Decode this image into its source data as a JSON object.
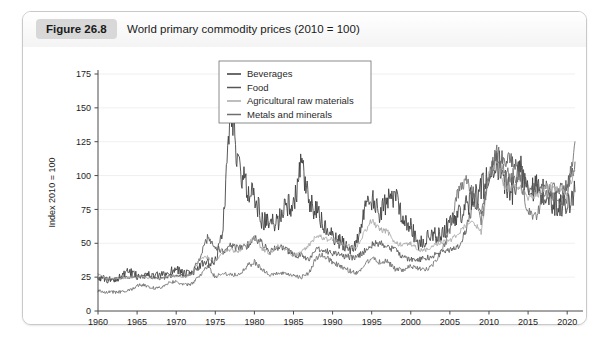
{
  "figure": {
    "badge": "Figure 26.8",
    "title": "World primary commodity prices (2010  =  100)"
  },
  "chart_data": {
    "type": "line",
    "title": "World primary commodity prices (2010  =  100)",
    "xlabel": "",
    "ylabel": "Index 2010 = 100",
    "xlim": [
      1960,
      2021
    ],
    "ylim": [
      0,
      175
    ],
    "ytick_step": 25,
    "yticks": [
      0,
      25,
      50,
      75,
      100,
      125,
      150,
      175
    ],
    "xticks": [
      1960,
      1965,
      1970,
      1975,
      1980,
      1985,
      1990,
      1995,
      2000,
      2005,
      2010,
      2015,
      2020
    ],
    "grid": true,
    "legend_position": "top-center",
    "colors": {
      "beverages": "#3a3a3a",
      "food": "#565656",
      "agricultural_raw_materials": "#a8a8a8",
      "metals_and_minerals": "#6e6e6e"
    },
    "x": [
      1960,
      1961,
      1962,
      1963,
      1964,
      1965,
      1966,
      1967,
      1968,
      1969,
      1970,
      1971,
      1972,
      1973,
      1974,
      1975,
      1976,
      1977,
      1978,
      1979,
      1980,
      1981,
      1982,
      1983,
      1984,
      1985,
      1986,
      1987,
      1988,
      1989,
      1990,
      1991,
      1992,
      1993,
      1994,
      1995,
      1996,
      1997,
      1998,
      1999,
      2000,
      2001,
      2002,
      2003,
      2004,
      2005,
      2006,
      2007,
      2008,
      2009,
      2010,
      2011,
      2012,
      2013,
      2014,
      2015,
      2016,
      2017,
      2018,
      2019,
      2020,
      2021
    ],
    "series": [
      {
        "name": "Beverages",
        "values": [
          25,
          23,
          23,
          26,
          29,
          26,
          27,
          26,
          26,
          28,
          32,
          27,
          28,
          33,
          35,
          36,
          62,
          158,
          104,
          92,
          85,
          67,
          64,
          66,
          80,
          76,
          108,
          79,
          73,
          62,
          54,
          51,
          47,
          48,
          73,
          82,
          72,
          80,
          87,
          70,
          62,
          49,
          53,
          57,
          56,
          66,
          71,
          76,
          85,
          90,
          100,
          111,
          96,
          88,
          106,
          93,
          91,
          87,
          80,
          79,
          78,
          88
        ],
        "stroke": "#3a3a3a"
      },
      {
        "name": "Food",
        "values": [
          24,
          24,
          23,
          25,
          25,
          25,
          26,
          25,
          24,
          25,
          27,
          26,
          28,
          39,
          54,
          47,
          44,
          48,
          46,
          48,
          54,
          50,
          44,
          47,
          46,
          41,
          41,
          38,
          45,
          45,
          43,
          41,
          40,
          39,
          44,
          49,
          50,
          48,
          45,
          40,
          38,
          38,
          39,
          41,
          44,
          45,
          47,
          59,
          79,
          74,
          100,
          114,
          112,
          110,
          107,
          89,
          90,
          92,
          90,
          89,
          92,
          110
        ],
        "stroke": "#565656"
      },
      {
        "name": "Agricultural raw materials",
        "values": [
          27,
          24,
          24,
          24,
          25,
          25,
          25,
          24,
          24,
          26,
          26,
          25,
          27,
          38,
          40,
          36,
          44,
          45,
          44,
          50,
          54,
          46,
          42,
          48,
          46,
          41,
          43,
          49,
          56,
          53,
          53,
          50,
          48,
          47,
          57,
          67,
          60,
          59,
          50,
          49,
          50,
          45,
          45,
          49,
          51,
          52,
          57,
          63,
          66,
          58,
          100,
          111,
          91,
          91,
          91,
          84,
          85,
          90,
          94,
          89,
          87,
          104
        ],
        "stroke": "#a8a8a8"
      },
      {
        "name": "Metals and minerals",
        "values": [
          15,
          14,
          14,
          14,
          15,
          19,
          19,
          17,
          17,
          21,
          22,
          19,
          20,
          26,
          33,
          25,
          28,
          27,
          27,
          33,
          36,
          31,
          26,
          28,
          27,
          26,
          25,
          28,
          40,
          41,
          36,
          33,
          30,
          28,
          33,
          40,
          36,
          37,
          31,
          30,
          33,
          31,
          31,
          35,
          45,
          59,
          87,
          96,
          87,
          66,
          100,
          118,
          103,
          100,
          97,
          73,
          70,
          85,
          86,
          83,
          84,
          125
        ],
        "stroke": "#6e6e6e"
      }
    ],
    "annotations": [
      {
        "text": "Beverages peak 1977",
        "value": 158
      },
      {
        "text": "Metals final 2021",
        "value": 125
      }
    ]
  },
  "legend": {
    "items": [
      {
        "label": "Beverages"
      },
      {
        "label": "Food"
      },
      {
        "label": "Agricultural raw materials"
      },
      {
        "label": "Metals and minerals"
      }
    ]
  }
}
